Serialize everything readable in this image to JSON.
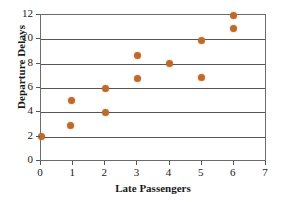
{
  "chart_data": {
    "type": "scatter",
    "title": "",
    "xlabel": "Late Passengers",
    "ylabel": "Departure Delays",
    "xlim": [
      0,
      7
    ],
    "ylim": [
      0,
      12
    ],
    "xticks": [
      0,
      1,
      2,
      3,
      4,
      5,
      6,
      7
    ],
    "xtick_labels": [
      "0",
      "1",
      "2",
      "3",
      "4",
      "5",
      "6",
      "7"
    ],
    "yticks": [
      0,
      2,
      4,
      6,
      8,
      10,
      12
    ],
    "ytick_labels": [
      "0",
      "2",
      "4",
      "6",
      "8",
      "10",
      "12"
    ],
    "grid": "horizontal",
    "legend": "none",
    "marker_color": "#bd6b2c",
    "axis_color": "#55555a",
    "points": [
      {
        "x": 0,
        "y": 2.0
      },
      {
        "x": 0.95,
        "y": 5.0
      },
      {
        "x": 0.92,
        "y": 2.9
      },
      {
        "x": 2.0,
        "y": 6.0
      },
      {
        "x": 2.0,
        "y": 4.0
      },
      {
        "x": 3.0,
        "y": 8.7
      },
      {
        "x": 3.0,
        "y": 6.8
      },
      {
        "x": 4.0,
        "y": 8.0
      },
      {
        "x": 5.0,
        "y": 9.9
      },
      {
        "x": 5.0,
        "y": 6.9
      },
      {
        "x": 6.0,
        "y": 12.0
      },
      {
        "x": 6.0,
        "y": 10.9
      }
    ],
    "x_values": [
      0,
      0.95,
      0.92,
      2,
      2,
      3,
      3,
      4,
      5,
      5,
      6,
      6
    ],
    "y_values": [
      2.0,
      5.0,
      2.9,
      6.0,
      4.0,
      8.7,
      6.8,
      8.0,
      9.9,
      6.9,
      12.0,
      10.9
    ]
  }
}
